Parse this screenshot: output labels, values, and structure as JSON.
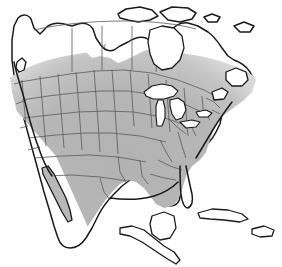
{
  "map": {
    "title": "North America Range Map",
    "width": 282,
    "height": 267,
    "background_color": "#ffffff",
    "projection_note": "North America, conic",
    "legend_note": "shaded area indicates species range"
  },
  "style": {
    "ocean_color": "#ffffff",
    "land_unshaded_color": "#ffffff",
    "range_fill_color": "#b8b8b8",
    "range_fill_soft_color": "#c9c9c9",
    "coastline_color": "#1a1a1a",
    "internal_border_color": "#5a5a5a",
    "lake_color": "#ffffff",
    "coastline_width": 1.5,
    "internal_border_width": 0.8
  },
  "regions": [
    {
      "name": "canada-northern",
      "shaded": false,
      "label": "Northern Canada"
    },
    {
      "name": "canada-southern",
      "shaded": true,
      "label": "Southern Canada"
    },
    {
      "name": "united-states",
      "shaded": true,
      "label": "Contiguous United States"
    },
    {
      "name": "mexico",
      "shaded": true,
      "label": "Mexico"
    },
    {
      "name": "baja-california",
      "shaded": true,
      "label": "Baja California"
    },
    {
      "name": "florida-peninsula",
      "shaded": true,
      "label": "Florida"
    },
    {
      "name": "great-lakes",
      "shaded": false,
      "label": "Great Lakes"
    },
    {
      "name": "cuba",
      "shaded": false,
      "label": "Cuba"
    },
    {
      "name": "hispaniola",
      "shaded": false,
      "label": "Hispaniola"
    },
    {
      "name": "yucatan",
      "shaded": false,
      "label": "Yucatan Peninsula"
    },
    {
      "name": "central-america",
      "shaded": false,
      "label": "Central America"
    },
    {
      "name": "newfoundland",
      "shaded": false,
      "label": "Newfoundland"
    },
    {
      "name": "vancouver-island",
      "shaded": false,
      "label": "Vancouver Island"
    },
    {
      "name": "arctic-islands",
      "shaded": false,
      "label": "Arctic Islands"
    }
  ],
  "range_extent": {
    "northern_limit_note": "arcs across southern Canada above the US border",
    "southern_limit_note": "fades out in southern Mexico near Guatemala",
    "includes_baja": true,
    "includes_florida": true,
    "excludes_caribbean": true
  }
}
